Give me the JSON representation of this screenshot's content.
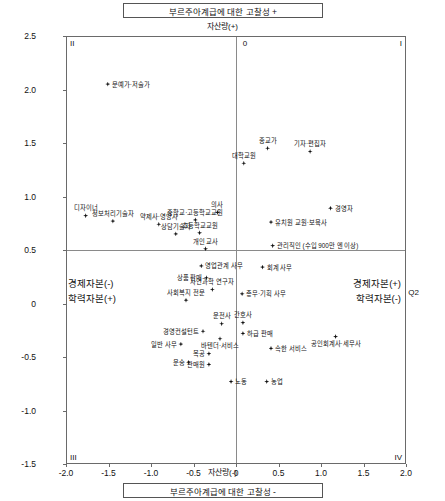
{
  "titles": {
    "top": "부르주아계급에 대한 고찰성 +",
    "bottom": "부르주아계급에 대한 고찰성 -",
    "axis_top": "자산량(+)",
    "axis_bottom": "자산량(-)"
  },
  "quadrants": {
    "q1": "I",
    "q2": "II",
    "q3": "III",
    "q4": "IV",
    "origin": "0"
  },
  "captions": {
    "economic_negative": "경제자본(-)",
    "education_positive": "학력자본(+)",
    "economic_positive": "경제자본(+)",
    "education_negative": "학력자본(-)",
    "dim2": "Q2"
  },
  "chart_data": {
    "type": "scatter",
    "title": "부르주아계급에 대한 고찰성 +",
    "subtitle": "부르주아계급에 대한 고찰성 -",
    "xlabel": "자산량(+)",
    "ylabel": "자산량(-)",
    "xlim": [
      -2.0,
      2.0
    ],
    "ylim": [
      -1.5,
      2.5
    ],
    "xticks": [
      "-2.0",
      "-1.5",
      "-1.0",
      "-0.5",
      "0",
      "0.5",
      "1.0",
      "1.5",
      "2.0"
    ],
    "yticks": [
      "2.5",
      "2.0",
      "1.5",
      "1.0",
      "0.5",
      "0",
      "-0.5",
      "-1.0",
      "-1.5"
    ],
    "grid": false,
    "legend": "none",
    "points": [
      {
        "label": "문예가·저술가",
        "x": -1.52,
        "y": 2.06,
        "pos": "right"
      },
      {
        "label": "디자이너",
        "x": -1.78,
        "y": 0.83,
        "pos": "above"
      },
      {
        "label": "정보처리기술자",
        "x": -1.46,
        "y": 0.78,
        "pos": "above"
      },
      {
        "label": "약제사·영양사",
        "x": -0.92,
        "y": 0.75,
        "pos": "above"
      },
      {
        "label": "상담기술자",
        "x": -0.72,
        "y": 0.66,
        "pos": "above"
      },
      {
        "label": "중학교·고등학교교원",
        "x": -0.49,
        "y": 0.79,
        "pos": "above"
      },
      {
        "label": "초등학교교원",
        "x": -0.44,
        "y": 0.67,
        "pos": "above"
      },
      {
        "label": "의사",
        "x": -0.23,
        "y": 0.86,
        "pos": "above"
      },
      {
        "label": "개인 교사",
        "x": -0.37,
        "y": 0.52,
        "pos": "above"
      },
      {
        "label": "영업관계 사무",
        "x": -0.42,
        "y": 0.36,
        "pos": "right"
      },
      {
        "label": "상품 판매",
        "x": -0.36,
        "y": 0.25,
        "pos": "left"
      },
      {
        "label": "자연과학 연구자",
        "x": -0.29,
        "y": 0.14,
        "pos": "above"
      },
      {
        "label": "사회복지 전문",
        "x": -0.6,
        "y": 0.04,
        "pos": "above"
      },
      {
        "label": "대학교원",
        "x": 0.08,
        "y": 1.32,
        "pos": "above"
      },
      {
        "label": "종교가",
        "x": 0.36,
        "y": 1.46,
        "pos": "above"
      },
      {
        "label": "기자·편집자",
        "x": 0.86,
        "y": 1.43,
        "pos": "above"
      },
      {
        "label": "경영자",
        "x": 1.1,
        "y": 0.9,
        "pos": "right"
      },
      {
        "label": "유치원 교원·보육사",
        "x": 0.4,
        "y": 0.77,
        "pos": "right"
      },
      {
        "label": "관리직인 (수입 900만 엔 이상)",
        "x": 0.42,
        "y": 0.55,
        "pos": "right"
      },
      {
        "label": "회계 사무",
        "x": 0.3,
        "y": 0.35,
        "pos": "right"
      },
      {
        "label": "총무·기획 사무",
        "x": 0.06,
        "y": 0.1,
        "pos": "right"
      },
      {
        "label": "운전사",
        "x": -0.18,
        "y": -0.18,
        "pos": "above"
      },
      {
        "label": "경영컨설턴트",
        "x": -0.4,
        "y": -0.25,
        "pos": "left"
      },
      {
        "label": "바텐더·서비스",
        "x": -0.2,
        "y": -0.32,
        "pos": "below"
      },
      {
        "label": "간호사",
        "x": 0.07,
        "y": -0.17,
        "pos": "above"
      },
      {
        "label": "하급 판매",
        "x": 0.07,
        "y": -0.27,
        "pos": "right"
      },
      {
        "label": "일반 사무",
        "x": -0.66,
        "y": -0.37,
        "pos": "left"
      },
      {
        "label": "목공",
        "x": -0.33,
        "y": -0.46,
        "pos": "left"
      },
      {
        "label": "운송",
        "x": -0.57,
        "y": -0.54,
        "pos": "left"
      },
      {
        "label": "판매원",
        "x": -0.33,
        "y": -0.56,
        "pos": "left"
      },
      {
        "label": "노동",
        "x": -0.07,
        "y": -0.72,
        "pos": "right"
      },
      {
        "label": "농업",
        "x": 0.35,
        "y": -0.72,
        "pos": "right"
      },
      {
        "label": "속한 서비스",
        "x": 0.4,
        "y": -0.41,
        "pos": "right"
      },
      {
        "label": "공인회계사·세무사",
        "x": 1.16,
        "y": -0.3,
        "pos": "below"
      }
    ]
  }
}
